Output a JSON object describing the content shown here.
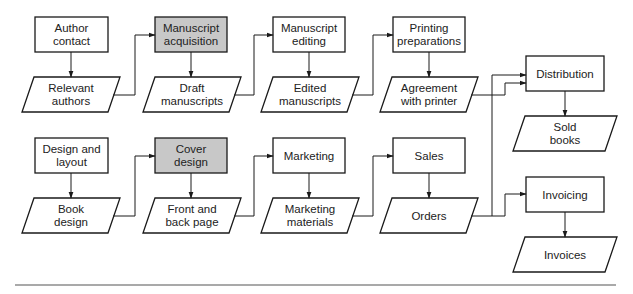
{
  "diagram": {
    "type": "flowchart",
    "colors": {
      "stroke": "#1a1a1a",
      "highlight_fill": "#c8c8c8",
      "box_fill": "#ffffff",
      "rule": "#555555"
    },
    "processes": [
      {
        "id": "author-contact",
        "lines": [
          "Author",
          "contact"
        ],
        "highlighted": false
      },
      {
        "id": "manuscript-acquisition",
        "lines": [
          "Manuscript",
          "acquisition"
        ],
        "highlighted": true
      },
      {
        "id": "manuscript-editing",
        "lines": [
          "Manuscript",
          "editing"
        ],
        "highlighted": false
      },
      {
        "id": "printing-preparations",
        "lines": [
          "Printing",
          "preparations"
        ],
        "highlighted": false
      },
      {
        "id": "design-and-layout",
        "lines": [
          "Design and",
          "layout"
        ],
        "highlighted": false
      },
      {
        "id": "cover-design",
        "lines": [
          "Cover",
          "design"
        ],
        "highlighted": true
      },
      {
        "id": "marketing",
        "lines": [
          "Marketing"
        ],
        "highlighted": false
      },
      {
        "id": "sales",
        "lines": [
          "Sales"
        ],
        "highlighted": false
      },
      {
        "id": "distribution",
        "lines": [
          "Distribution"
        ],
        "highlighted": false
      },
      {
        "id": "invoicing",
        "lines": [
          "Invoicing"
        ],
        "highlighted": false
      }
    ],
    "outputs": [
      {
        "id": "relevant-authors",
        "lines": [
          "Relevant",
          "authors"
        ]
      },
      {
        "id": "draft-manuscripts",
        "lines": [
          "Draft",
          "manuscripts"
        ]
      },
      {
        "id": "edited-manuscripts",
        "lines": [
          "Edited",
          "manuscripts"
        ]
      },
      {
        "id": "agreement-with-printer",
        "lines": [
          "Agreement",
          "with printer"
        ]
      },
      {
        "id": "book-design",
        "lines": [
          "Book",
          "design"
        ]
      },
      {
        "id": "front-and-back-page",
        "lines": [
          "Front and",
          "back page"
        ]
      },
      {
        "id": "marketing-materials",
        "lines": [
          "Marketing",
          "materials"
        ]
      },
      {
        "id": "orders",
        "lines": [
          "Orders"
        ]
      },
      {
        "id": "sold-books",
        "lines": [
          "Sold",
          "books"
        ]
      },
      {
        "id": "invoices",
        "lines": [
          "Invoices"
        ]
      }
    ],
    "edges": [
      [
        "author-contact",
        "relevant-authors"
      ],
      [
        "relevant-authors",
        "manuscript-acquisition"
      ],
      [
        "manuscript-acquisition",
        "draft-manuscripts"
      ],
      [
        "draft-manuscripts",
        "manuscript-editing"
      ],
      [
        "manuscript-editing",
        "edited-manuscripts"
      ],
      [
        "edited-manuscripts",
        "printing-preparations"
      ],
      [
        "printing-preparations",
        "agreement-with-printer"
      ],
      [
        "agreement-with-printer",
        "distribution"
      ],
      [
        "design-and-layout",
        "book-design"
      ],
      [
        "book-design",
        "cover-design"
      ],
      [
        "cover-design",
        "front-and-back-page"
      ],
      [
        "front-and-back-page",
        "marketing"
      ],
      [
        "marketing",
        "marketing-materials"
      ],
      [
        "marketing-materials",
        "sales"
      ],
      [
        "sales",
        "orders"
      ],
      [
        "orders",
        "distribution"
      ],
      [
        "orders",
        "invoicing"
      ],
      [
        "distribution",
        "sold-books"
      ],
      [
        "invoicing",
        "invoices"
      ]
    ]
  }
}
